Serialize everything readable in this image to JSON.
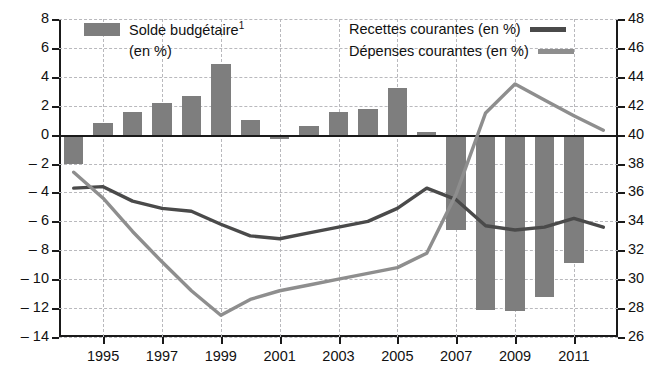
{
  "chart_data": {
    "type": "bar",
    "title": "",
    "subtitle": "",
    "xlabel": "",
    "ylabel": "",
    "grid": true,
    "legend_position": "top",
    "x": [
      1994,
      1995,
      1996,
      1997,
      1998,
      1999,
      2000,
      2001,
      2002,
      2003,
      2004,
      2005,
      2006,
      2007,
      2008,
      2009,
      2010,
      2011,
      2012
    ],
    "categories": [
      "1994",
      "1995",
      "1996",
      "1997",
      "1998",
      "1999",
      "2000",
      "2001",
      "2002",
      "2003",
      "2004",
      "2005",
      "2006",
      "2007",
      "2008",
      "2009",
      "2010",
      "2011",
      "2012"
    ],
    "x_tick_labels": [
      "1995",
      "1997",
      "1999",
      "2001",
      "2003",
      "2005",
      "2007",
      "2009",
      "2011"
    ],
    "x_tick_values": [
      1995,
      1997,
      1999,
      2001,
      2003,
      2005,
      2007,
      2009,
      2011
    ],
    "left_axis": {
      "label": "Solde budgétaire (en %)",
      "ylim": [
        -14,
        8
      ],
      "ticks": [
        8,
        6,
        4,
        2,
        0,
        -2,
        -4,
        -6,
        -8,
        -10,
        -12,
        -14
      ],
      "tick_labels": [
        "8",
        "6",
        "4",
        "2",
        "0",
        "– 2",
        "– 4",
        "– 6",
        "– 8",
        "– 10",
        "– 12",
        "– 14"
      ]
    },
    "right_axis": {
      "label": "Recettes / Dépenses courantes (en %)",
      "ylim": [
        26,
        48
      ],
      "ticks": [
        48,
        46,
        44,
        42,
        40,
        38,
        36,
        34,
        32,
        30,
        28,
        26
      ],
      "tick_labels": [
        "48",
        "46",
        "44",
        "42",
        "40",
        "38",
        "36",
        "34",
        "32",
        "30",
        "28",
        "26"
      ]
    },
    "series": [
      {
        "name": "Solde budgétaire",
        "legend_label": "Solde budgétaire",
        "legend_label_suffix": "1",
        "legend_label_line2": "(en %)",
        "type": "bar",
        "axis": "left",
        "color": "#7e7e7e",
        "values": [
          -2.0,
          0.8,
          1.6,
          2.2,
          2.7,
          4.9,
          1.0,
          -0.3,
          0.6,
          1.6,
          1.8,
          3.2,
          0.2,
          -6.6,
          -12.1,
          -12.2,
          -11.2,
          -8.9,
          null
        ]
      },
      {
        "name": "Recettes courantes",
        "legend_label": "Recettes courantes (en %)",
        "type": "line",
        "axis": "right",
        "color": "#4a4a4a",
        "values": [
          36.3,
          36.4,
          35.4,
          34.9,
          34.7,
          33.8,
          33.0,
          32.8,
          33.2,
          33.6,
          34.0,
          34.9,
          36.3,
          35.5,
          33.7,
          33.4,
          33.6,
          34.2,
          33.6
        ]
      },
      {
        "name": "Dépenses courantes",
        "legend_label": "Dépenses courantes (en %)",
        "type": "line",
        "axis": "right",
        "color": "#8e8e8e",
        "values": [
          37.4,
          35.6,
          33.3,
          31.2,
          29.2,
          27.5,
          28.6,
          29.2,
          29.6,
          30.0,
          30.4,
          30.8,
          31.8,
          35.9,
          41.5,
          43.5,
          42.4,
          41.3,
          40.3
        ]
      }
    ],
    "notes": {
      "footnote_marker": "1"
    }
  }
}
